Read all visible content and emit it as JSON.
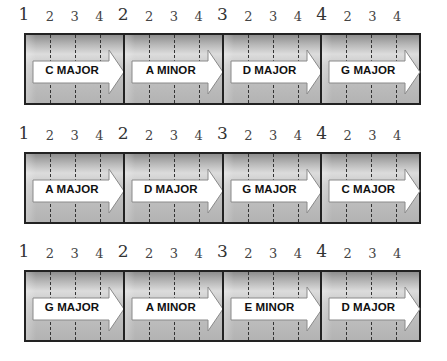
{
  "diagram": {
    "rows": [
      {
        "beat_labels": [
          "1",
          "2",
          "3",
          "4",
          "2",
          "2",
          "3",
          "4",
          "3",
          "2",
          "3",
          "4",
          "4",
          "2",
          "3",
          "4"
        ],
        "chords": [
          "C MAJOR",
          "A MINOR",
          "D MAJOR",
          "G MAJOR"
        ]
      },
      {
        "beat_labels": [
          "1",
          "2",
          "3",
          "4",
          "2",
          "2",
          "3",
          "4",
          "3",
          "2",
          "3",
          "4",
          "4",
          "2",
          "3",
          "4"
        ],
        "chords": [
          "A MAJOR",
          "D MAJOR",
          "G MAJOR",
          "C MAJOR"
        ]
      },
      {
        "beat_labels": [
          "1",
          "2",
          "3",
          "4",
          "2",
          "2",
          "3",
          "4",
          "3",
          "2",
          "3",
          "4",
          "4",
          "2",
          "3",
          "4"
        ],
        "chords": [
          "G MAJOR",
          "A MINOR",
          "E MINOR",
          "D MAJOR"
        ]
      }
    ],
    "colors": {
      "strip_border": "#222222",
      "strip_fill_dark": "#8e8e8e",
      "strip_fill_light": "#dcdcdc",
      "arrow_fill": "#ffffff",
      "arrow_outline": "#8a8a8a",
      "text": "#111111"
    }
  }
}
